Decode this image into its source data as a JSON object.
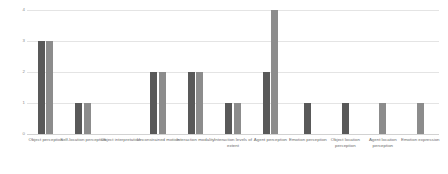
{
  "chart_data": {
    "type": "bar",
    "title": "",
    "xlabel": "",
    "ylabel": "",
    "ylim": [
      0,
      4
    ],
    "yticks": [
      "0",
      "1",
      "2",
      "3",
      "4"
    ],
    "grid": true,
    "legend": "none",
    "orientation": "vertical",
    "categories": [
      "Object perception",
      "Self-location perception",
      "Object interpretation",
      "Unconstrained motion",
      "Interaction modality",
      "Interaction levels of extent",
      "Agent perception",
      "Emotion perception",
      "Object location perception",
      "Agent location perception",
      "Emotion expression"
    ],
    "series": [
      {
        "name": "Series 1",
        "color": "#595959",
        "values": [
          3,
          1,
          0,
          2,
          2,
          1,
          2,
          1,
          1,
          0,
          0
        ]
      },
      {
        "name": "Series 2",
        "color": "#8c8c8c",
        "values": [
          3,
          1,
          0,
          2,
          2,
          1,
          4,
          0,
          0,
          1,
          1
        ]
      }
    ]
  },
  "colors": {
    "series_1": "#595959",
    "series_2": "#8c8c8c",
    "gridline": "#e4e4e4",
    "axis_text": "#8a8a8a",
    "category_text": "#6d6d6d",
    "background": "#ffffff"
  }
}
